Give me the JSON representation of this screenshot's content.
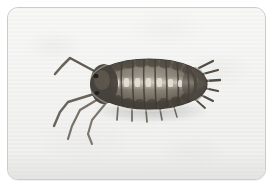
{
  "figure": {
    "kind": "photograph",
    "subject_label": "Woodlouse (sowbug) specimen, dorsal view",
    "caption": "",
    "orientation": "head at left, telson and uropods at right",
    "color_mode": "grayscale"
  },
  "frame": {
    "border_color": "#c9cbcd",
    "corner_radius_px": 11,
    "background_color": "#ffffff"
  },
  "photo": {
    "background_color": "#f2f2f1",
    "background_highlight": "#f7f7f6",
    "background_shadow": "#e7e7e5",
    "texture": "faint mottled paper with light horizontal scan banding"
  },
  "specimen": {
    "common_name": "Woodlouse",
    "alt_names": [
      "Sowbug",
      "Pill bug",
      "Slater"
    ],
    "body": {
      "outline_color": "#4a4743",
      "shell_dark": "#5d574f",
      "shell_mid": "#7d766c",
      "shell_light": "#b6ae a2",
      "ridge_highlight": "#d9d3c7",
      "segment_count": 9,
      "shape": "elongate oval, strongly convex, tapering at both ends"
    },
    "legs": {
      "color": "#6f685f",
      "visible_count": 7,
      "note": "long slender legs projecting forward-left and downward-left"
    },
    "antennae": {
      "color": "#5f594f",
      "count": 2,
      "note": "one long antenna angled up-left, one angled down-left"
    },
    "uropods": {
      "color": "#565047",
      "count": 6,
      "note": "short pointed spines fanning from the posterior right end"
    },
    "shadow": {
      "color": "rgba(150,150,146,0.38)",
      "note": "soft cast shadow beneath the body"
    }
  }
}
